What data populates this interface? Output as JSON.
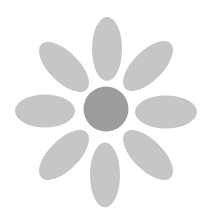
{
  "image": {
    "width": 208,
    "height": 218,
    "background": "#ffffff",
    "subject": "flower-icon"
  },
  "flower": {
    "center": {
      "cx": 106,
      "cy": 109,
      "r": 22.5,
      "fill": "#9c9c9c"
    },
    "petal_fill": "#c6c6c6",
    "petals": [
      {
        "name": "petal-top",
        "cx": 107,
        "cy": 49,
        "rx": 15,
        "ry": 32,
        "rotate": 0
      },
      {
        "name": "petal-top-right",
        "cx": 148,
        "cy": 66,
        "rx": 15,
        "ry": 32,
        "rotate": 45
      },
      {
        "name": "petal-right",
        "cx": 166,
        "cy": 112,
        "rx": 31,
        "ry": 16.5,
        "rotate": 0
      },
      {
        "name": "petal-bottom-right",
        "cx": 148,
        "cy": 155,
        "rx": 15,
        "ry": 32,
        "rotate": -45
      },
      {
        "name": "petal-bottom",
        "cx": 105,
        "cy": 175,
        "rx": 15,
        "ry": 32.5,
        "rotate": 0
      },
      {
        "name": "petal-bottom-left",
        "cx": 64,
        "cy": 155,
        "rx": 15,
        "ry": 32,
        "rotate": 45
      },
      {
        "name": "petal-left",
        "cx": 45,
        "cy": 111,
        "rx": 30,
        "ry": 16.5,
        "rotate": 0
      },
      {
        "name": "petal-top-left",
        "cx": 64,
        "cy": 67,
        "rx": 15,
        "ry": 32,
        "rotate": -45
      }
    ]
  }
}
